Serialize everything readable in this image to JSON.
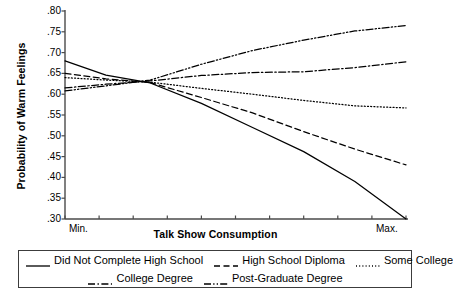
{
  "chart_data": {
    "type": "line",
    "title": "",
    "xlabel": "Talk Show Consumption",
    "ylabel": "Probability of Warm Feelings",
    "xlim": [
      0,
      1
    ],
    "ylim": [
      0.3,
      0.8
    ],
    "grid": false,
    "legend_position": "bottom",
    "xtick_labels": [
      "Min.",
      "Max."
    ],
    "ytick_labels": [
      ".80",
      ".75",
      ".70",
      ".65",
      ".60",
      ".55",
      ".50",
      ".45",
      ".40",
      ".35",
      ".30"
    ],
    "ytick_values": [
      0.8,
      0.75,
      0.7,
      0.65,
      0.6,
      0.55,
      0.5,
      0.45,
      0.4,
      0.35,
      0.3
    ],
    "x": [
      0.0,
      0.12,
      0.25,
      0.4,
      0.55,
      0.7,
      0.85,
      1.0
    ],
    "series": [
      {
        "name": "Did Not Complete High School",
        "style": "solid",
        "values": [
          0.68,
          0.646,
          0.627,
          0.578,
          0.52,
          0.462,
          0.39,
          0.3
        ]
      },
      {
        "name": "High School Diploma",
        "style": "dashed",
        "values": [
          0.65,
          0.637,
          0.628,
          0.592,
          0.555,
          0.51,
          0.468,
          0.43
        ]
      },
      {
        "name": "Some College",
        "style": "dotted",
        "values": [
          0.64,
          0.634,
          0.629,
          0.614,
          0.6,
          0.585,
          0.572,
          0.567
        ]
      },
      {
        "name": "College Degree",
        "style": "dash-dot",
        "values": [
          0.615,
          0.624,
          0.632,
          0.645,
          0.652,
          0.654,
          0.664,
          0.678
        ]
      },
      {
        "name": "Post-Graduate Degree",
        "style": "dash-dot-dot",
        "values": [
          0.608,
          0.62,
          0.634,
          0.672,
          0.705,
          0.73,
          0.752,
          0.765
        ]
      }
    ]
  },
  "legend": {
    "rows": [
      [
        {
          "label": "Did Not Complete High School",
          "style": "solid"
        },
        {
          "label": "High School Diploma",
          "style": "dashed"
        },
        {
          "label": "Some College",
          "style": "dotted"
        }
      ],
      [
        {
          "label": "College Degree",
          "style": "dash-dot"
        },
        {
          "label": "Post-Graduate Degree",
          "style": "dash-dot-dot"
        }
      ]
    ]
  },
  "colors": {
    "line": "#000000",
    "axis": "#4a4a4a",
    "text": "#000000",
    "background": "#ffffff"
  }
}
